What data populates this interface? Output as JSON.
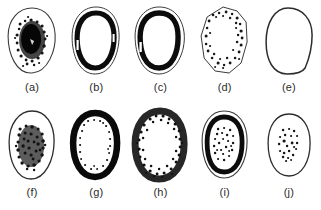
{
  "figure": {
    "background_color": "#ffffff",
    "ink_color": "#1a1a1a",
    "outline_color": "#3a3a3a",
    "rows": 2,
    "columns": 5,
    "panel_count": 10
  },
  "panels": [
    {
      "id": "a",
      "label": "(a)",
      "outline": "thin smooth oval",
      "fill_pattern": "dense solid speckle cluster filling the centre",
      "ring": "none",
      "speckle_density": "very-high",
      "speckle_region": "core"
    },
    {
      "id": "b",
      "label": "(b)",
      "outline": "thin smooth oval with inner thick black ring",
      "fill_pattern": "empty centre",
      "ring": "thick solid black band just inside the outline",
      "speckle_density": "none",
      "speckle_region": "none"
    },
    {
      "id": "c",
      "label": "(c)",
      "outline": "thin smooth oval with inner thick black ring",
      "fill_pattern": "empty centre",
      "ring": "thick solid black band just inside the outline",
      "speckle_density": "none",
      "speckle_region": "none"
    },
    {
      "id": "d",
      "label": "(d)",
      "outline": "thin angular polygonal oval",
      "fill_pattern": "speckles arranged as an annulus near the border",
      "ring": "speckled ring",
      "speckle_density": "medium",
      "speckle_region": "annulus"
    },
    {
      "id": "e",
      "label": "(e)",
      "outline": "thin smooth rounded outline, slightly flattened base",
      "fill_pattern": "completely empty",
      "ring": "none",
      "speckle_density": "none",
      "speckle_region": "none"
    },
    {
      "id": "f",
      "label": "(f)",
      "outline": "thin smooth oval",
      "fill_pattern": "dense solid speckle cluster filling the centre",
      "ring": "none",
      "speckle_density": "very-high",
      "speckle_region": "core"
    },
    {
      "id": "g",
      "label": "(g)",
      "outline": "thick solid black band forming the whole rim",
      "fill_pattern": "empty centre with small speckles along the inner rim edge",
      "ring": "thick solid black ring",
      "speckle_density": "low",
      "speckle_region": "inner-rim"
    },
    {
      "id": "h",
      "label": "(h)",
      "outline": "ragged speckled heavy rim",
      "fill_pattern": "empty centre",
      "ring": "broad noisy speckled ring",
      "speckle_density": "high",
      "speckle_region": "annulus"
    },
    {
      "id": "i",
      "label": "(i)",
      "outline": "thin outer oval plus thick black inner ring",
      "fill_pattern": "speckled cluster in the centre",
      "ring": "thick solid black ring",
      "speckle_density": "medium",
      "speckle_region": "core"
    },
    {
      "id": "j",
      "label": "(j)",
      "outline": "thin smooth oval",
      "fill_pattern": "sparse speckle cluster in the centre",
      "ring": "none",
      "speckle_density": "low",
      "speckle_region": "core"
    }
  ]
}
